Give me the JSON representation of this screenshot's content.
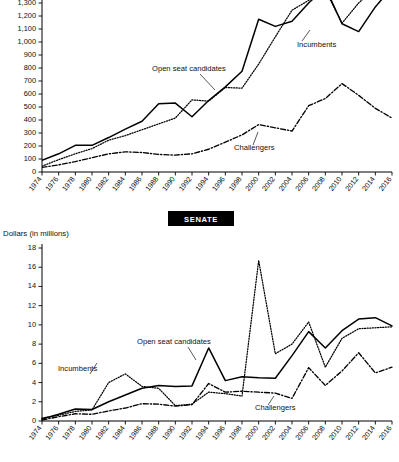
{
  "chart_data": [
    {
      "id": "house",
      "type": "line",
      "title": "",
      "xlabel": "",
      "ylabel": "",
      "ylim": [
        0,
        1400
      ],
      "ytick_step": 100,
      "yticks": [
        "0",
        "100",
        "200",
        "300",
        "400",
        "500",
        "600",
        "700",
        "800",
        "900",
        "1,000",
        "1,100",
        "1,200",
        "1,300",
        "1,400"
      ],
      "grid": false,
      "note": "Top panel is cropped at the top edge; the 1,400 gridline label is only partly visible.",
      "x": [
        1974,
        1976,
        1978,
        1980,
        1982,
        1984,
        1986,
        1988,
        1990,
        1992,
        1994,
        1996,
        1998,
        2000,
        2002,
        2004,
        2006,
        2008,
        2010,
        2012,
        2014,
        2016
      ],
      "xtick_labels": [
        "1974",
        "1976",
        "1978",
        "1980",
        "1982",
        "1984",
        "1986",
        "1988",
        "1990",
        "1992",
        "1994",
        "1996",
        "1998",
        "2000",
        "2002",
        "2004",
        "2006",
        "2008",
        "2010",
        "2012",
        "2014",
        "2016"
      ],
      "series": [
        {
          "name": "Open seat candidates",
          "style": "solid",
          "values": [
            90,
            140,
            205,
            205,
            265,
            330,
            390,
            525,
            530,
            425,
            550,
            655,
            775,
            1175,
            1120,
            1160,
            1300,
            1420,
            1140,
            1080,
            1270,
            1420
          ]
        },
        {
          "name": "Incumbents",
          "style": "dotted",
          "values": [
            45,
            95,
            140,
            180,
            245,
            280,
            325,
            370,
            415,
            555,
            545,
            650,
            645,
            830,
            1040,
            1245,
            1320,
            1400,
            1145,
            1300,
            1420,
            1430
          ]
        },
        {
          "name": "Challengers",
          "style": "dashdot",
          "values": [
            35,
            55,
            80,
            110,
            140,
            155,
            150,
            135,
            130,
            140,
            175,
            230,
            285,
            365,
            340,
            315,
            510,
            565,
            680,
            590,
            490,
            415
          ]
        }
      ],
      "annotations": [
        {
          "text": "Open seat candidates",
          "series": "Open seat candidates"
        },
        {
          "text": "Incumbents",
          "series": "Incumbents"
        },
        {
          "text": "Challengers",
          "series": "Challengers"
        }
      ]
    },
    {
      "id": "senate",
      "type": "line",
      "title": "SENATE",
      "xlabel": "",
      "ylabel": "Dollars (in millions)",
      "ylim": [
        0,
        18
      ],
      "ytick_step": 2,
      "yticks": [
        "0",
        "2",
        "4",
        "6",
        "8",
        "10",
        "12",
        "14",
        "16",
        "18"
      ],
      "grid": false,
      "x": [
        1974,
        1976,
        1978,
        1980,
        1982,
        1984,
        1986,
        1988,
        1990,
        1992,
        1994,
        1996,
        1998,
        2000,
        2002,
        2004,
        2006,
        2008,
        2010,
        2012,
        2014,
        2016
      ],
      "xtick_labels": [
        "1974",
        "1976",
        "1978",
        "1980",
        "1982",
        "1984",
        "1986",
        "1988",
        "1990",
        "1992",
        "1994",
        "1996",
        "1998",
        "2000",
        "2002",
        "2004",
        "2006",
        "2008",
        "2010",
        "2012",
        "2014",
        "2016"
      ],
      "series": [
        {
          "name": "Open seat candidates",
          "style": "solid",
          "values": [
            0.2,
            0.7,
            1.25,
            1.2,
            2.0,
            2.7,
            3.4,
            3.7,
            3.6,
            3.65,
            7.6,
            4.2,
            4.6,
            4.5,
            4.45,
            6.8,
            9.3,
            7.6,
            9.4,
            10.6,
            10.75,
            9.9
          ]
        },
        {
          "name": "Incumbents",
          "style": "dotted",
          "values": [
            0.3,
            0.6,
            1.0,
            1.15,
            4.0,
            4.9,
            3.6,
            3.4,
            1.6,
            1.75,
            3.0,
            2.85,
            2.6,
            16.7,
            7.0,
            8.0,
            10.3,
            5.6,
            8.6,
            9.6,
            9.7,
            9.8
          ]
        },
        {
          "name": "Challengers",
          "style": "dashdot",
          "values": [
            0.1,
            0.45,
            0.75,
            0.7,
            1.05,
            1.35,
            1.8,
            1.75,
            1.55,
            1.7,
            3.9,
            3.0,
            3.1,
            3.0,
            2.9,
            2.35,
            5.55,
            3.7,
            5.2,
            7.1,
            5.0,
            5.6
          ]
        }
      ],
      "annotations": [
        {
          "text": "Open seat candidates",
          "series": "Open seat candidates"
        },
        {
          "text": "Incumbents",
          "series": "Incumbents"
        },
        {
          "text": "Challengers",
          "series": "Challengers"
        }
      ]
    }
  ],
  "legend_labels": {
    "open_seat": "Open seat candidates",
    "incumbents": "Incumbents",
    "challengers": "Challengers"
  },
  "senate_badge": "SENATE",
  "senate_axis_title": "Dollars (in millions)"
}
